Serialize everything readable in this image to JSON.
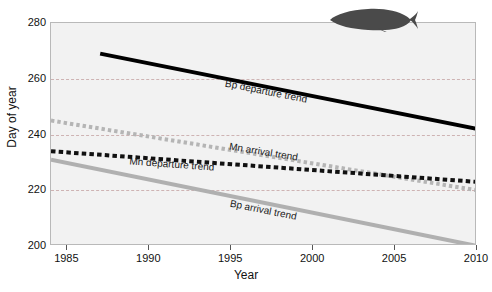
{
  "figure": {
    "background_color": "#ffffff",
    "plot_background_color": "#f2f2f2",
    "gridline_color": "#c8a9a9",
    "decoration": {
      "whale_icon": "whale-silhouette",
      "whale_color": "#4a4a4a"
    }
  },
  "chart_data": {
    "type": "line",
    "title": "",
    "xlabel": "Year",
    "ylabel": "Day of year",
    "xlim": [
      1984,
      2010
    ],
    "ylim": [
      200,
      280
    ],
    "xticks": [
      1985,
      1990,
      1995,
      2000,
      2005,
      2010
    ],
    "yticks": [
      200,
      220,
      240,
      260,
      280
    ],
    "grid": "horizontal-dashed",
    "gridlines": [
      220,
      240,
      260
    ],
    "legend": "inline-labels",
    "series": [
      {
        "name": "Bp departure trend",
        "label": "Bp departure trend",
        "style": "solid",
        "color": "#000000",
        "width": 4,
        "x": [
          1987,
          2010
        ],
        "y": [
          269,
          242
        ],
        "label_x": 1997.2,
        "label_y": 258.5
      },
      {
        "name": "Mn arrival trend",
        "label": "Mn arrival trend",
        "style": "dotted",
        "color": "#b5b5b5",
        "width": 4,
        "x": [
          1984,
          2010
        ],
        "y": [
          245,
          220
        ],
        "label_x": 1997.0,
        "label_y": 236.0
      },
      {
        "name": "Mn departure trend",
        "label": "Mn departure trend",
        "style": "dashed",
        "color": "#111111",
        "width": 4,
        "x": [
          1984,
          2010
        ],
        "y": [
          234,
          223
        ],
        "label_x": 1991.4,
        "label_y": 230.5
      },
      {
        "name": "Bp arrival trend",
        "label": "Bp arrival trend",
        "style": "solid",
        "color": "#b0b0b0",
        "width": 4,
        "x": [
          1984,
          2010
        ],
        "y": [
          231,
          200
        ],
        "label_x": 1997.0,
        "label_y": 215.5
      }
    ]
  }
}
